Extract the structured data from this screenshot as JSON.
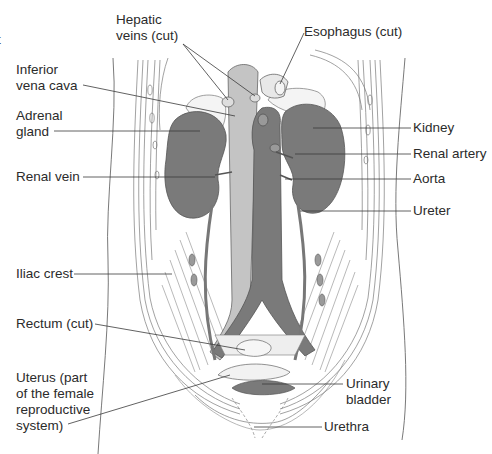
{
  "diagram": {
    "type": "anatomical-illustration",
    "colors": {
      "organ_dark": "#7a7a7a",
      "vessel_light": "#c4c4c4",
      "line": "#4a4a4a",
      "text": "#2b2b2b",
      "background": "#ffffff"
    },
    "edge_fragment": "t",
    "labels_left": [
      {
        "id": "inferior-vena-cava",
        "text": "Inferior\nvena cava"
      },
      {
        "id": "adrenal-gland",
        "text": "Adrenal\ngland"
      },
      {
        "id": "renal-vein",
        "text": "Renal vein"
      },
      {
        "id": "iliac-crest",
        "text": "Iliac crest"
      },
      {
        "id": "rectum",
        "text": "Rectum (cut)"
      },
      {
        "id": "uterus",
        "text": "Uterus (part\nof the female\nreproductive\nsystem)"
      }
    ],
    "labels_top": [
      {
        "id": "hepatic-veins",
        "text": "Hepatic\nveins (cut)"
      },
      {
        "id": "esophagus",
        "text": "Esophagus (cut)"
      }
    ],
    "labels_right": [
      {
        "id": "kidney",
        "text": "Kidney"
      },
      {
        "id": "renal-artery",
        "text": "Renal artery"
      },
      {
        "id": "aorta",
        "text": "Aorta"
      },
      {
        "id": "ureter",
        "text": "Ureter"
      },
      {
        "id": "urinary-bladder",
        "text": "Urinary\nbladder"
      },
      {
        "id": "urethra",
        "text": "Urethra"
      }
    ]
  }
}
